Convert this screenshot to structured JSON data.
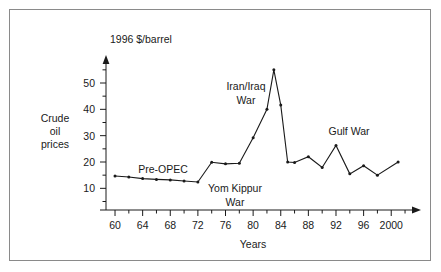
{
  "figure": {
    "background_color": "#ffffff",
    "border_color": "#8a8a8a",
    "ink_color": "#1a1a1a"
  },
  "chart_data": {
    "type": "line",
    "title": "",
    "subtitle": "",
    "xlabel": "Years",
    "ylabel": "Crude oil prices",
    "unit_label": "1996 $/barrel",
    "xlim": [
      59,
      2001
    ],
    "ylim": [
      0,
      60
    ],
    "grid": false,
    "legend": "none",
    "x_tick_labels": [
      "60",
      "64",
      "68",
      "72",
      "76",
      "80",
      "84",
      "88",
      "92",
      "96",
      "2000"
    ],
    "x_tick_values": [
      1960,
      1964,
      1968,
      1972,
      1976,
      1980,
      1984,
      1988,
      1992,
      1996,
      2000
    ],
    "x_minor_step": 2,
    "y_tick_labels": [
      "10",
      "20",
      "30",
      "40",
      "50"
    ],
    "y_tick_values": [
      10,
      20,
      30,
      40,
      50
    ],
    "y_minor_step": 5,
    "series": [
      {
        "name": "Crude oil prices",
        "x": [
          1960,
          1962,
          1964,
          1966,
          1968,
          1970,
          1972,
          1974,
          1976,
          1978,
          1980,
          1982,
          1983,
          1984,
          1985,
          1986,
          1988,
          1990,
          1992,
          1994,
          1996,
          1998,
          2001
        ],
        "values": [
          14.7,
          14.3,
          13.7,
          13.4,
          13.2,
          12.8,
          12.4,
          19.9,
          19.3,
          19.5,
          29.2,
          40.0,
          55.0,
          41.6,
          20.0,
          19.8,
          22.0,
          17.9,
          26.3,
          15.5,
          18.6,
          15.0,
          20.0
        ]
      }
    ],
    "annotations": [
      {
        "id": "pre-opec",
        "text": "Pre-OPEC",
        "lines": [
          "Pre-OPEC"
        ],
        "x": 1967.0,
        "y": 17.4
      },
      {
        "id": "yom-kippur-war",
        "text": "Yom Kippur War",
        "lines": [
          "Yom Kippur",
          "War"
        ],
        "x": 1976.6,
        "y": 14.0
      },
      {
        "id": "iran-iraq-war",
        "text": "Iran/Iraq War",
        "lines": [
          "Iran/Iraq",
          "War"
        ],
        "x": 1979.6,
        "y": 46.5
      },
      {
        "id": "gulf-war",
        "text": "Gulf War",
        "lines": [
          "Gulf War"
        ],
        "x": 1993.2,
        "y": 31.5
      }
    ]
  }
}
